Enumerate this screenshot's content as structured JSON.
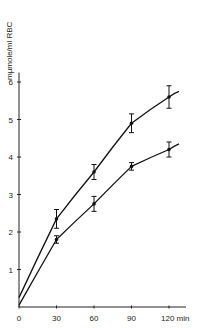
{
  "chart_data": {
    "type": "line",
    "title": "",
    "xlabel": "min",
    "ylabel": "mµmole/ml RBC",
    "xlim": [
      0,
      128
    ],
    "ylim": [
      0,
      6.2
    ],
    "x_ticks": [
      0,
      30,
      60,
      90,
      120
    ],
    "x_tick_labels": [
      "0",
      "30",
      "60",
      "90",
      "120 min"
    ],
    "y_ticks": [
      1,
      2,
      3,
      4,
      5,
      6
    ],
    "y_tick_labels": [
      "1",
      "2",
      "3",
      "4",
      "5",
      "6"
    ],
    "grid": false,
    "legend": null,
    "series": [
      {
        "name": "upper curve",
        "x": [
          0,
          30,
          60,
          90,
          120
        ],
        "values": [
          0.25,
          2.35,
          3.6,
          4.9,
          5.6
        ],
        "error": [
          0,
          0.25,
          0.2,
          0.25,
          0.3
        ],
        "fit_end": [
          128,
          5.75
        ]
      },
      {
        "name": "lower curve",
        "x": [
          0,
          30,
          60,
          90,
          120
        ],
        "values": [
          0.05,
          1.8,
          2.75,
          3.75,
          4.2
        ],
        "error": [
          0,
          0.1,
          0.2,
          0.1,
          0.2
        ],
        "fit_end": [
          128,
          4.35
        ]
      }
    ]
  }
}
